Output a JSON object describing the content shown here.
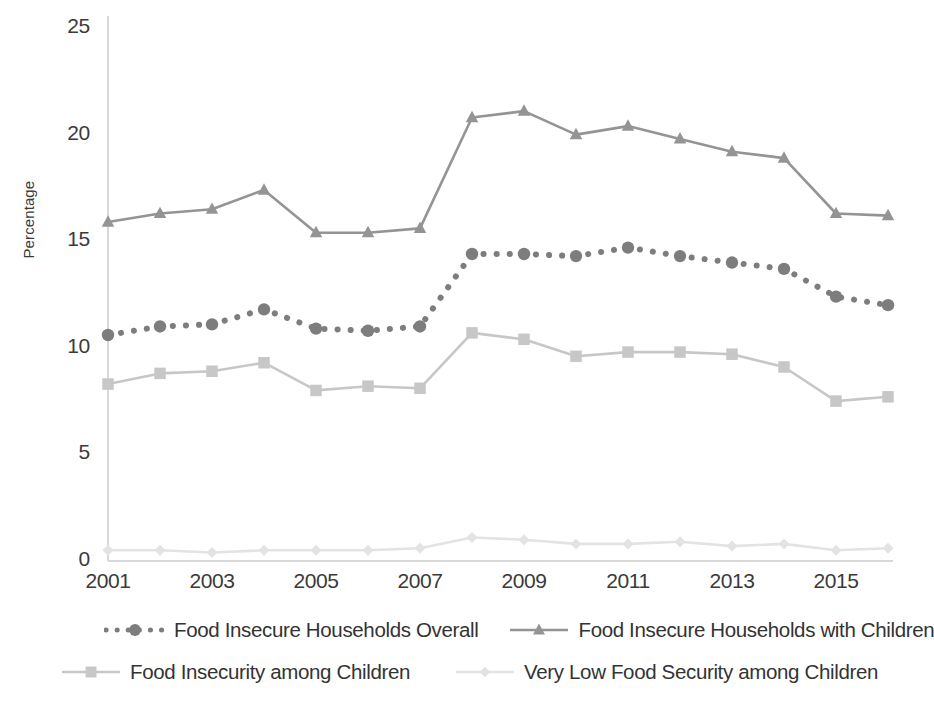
{
  "chart_data": {
    "type": "line",
    "title": "",
    "subtitle": "",
    "xlabel": "",
    "ylabel": "Percentage",
    "x": [
      2001,
      2002,
      2003,
      2004,
      2005,
      2006,
      2007,
      2008,
      2009,
      2010,
      2011,
      2012,
      2013,
      2014,
      2015,
      2016
    ],
    "xtick_labels": [
      "2001",
      "2003",
      "2005",
      "2007",
      "2009",
      "2011",
      "2013",
      "2015"
    ],
    "xtick_values": [
      2001,
      2003,
      2005,
      2007,
      2009,
      2011,
      2013,
      2015
    ],
    "ytick_labels": [
      "0",
      "5",
      "10",
      "15",
      "20",
      "25"
    ],
    "ytick_values": [
      0,
      5,
      10,
      15,
      20,
      25
    ],
    "ylim": [
      0,
      25
    ],
    "xlim": [
      2001,
      2016
    ],
    "grid": false,
    "legend_position": "bottom",
    "series": [
      {
        "name": "Food Insecure Households Overall",
        "marker": "circle",
        "linestyle": "dotted",
        "color": "#7d7d7d",
        "values": [
          10.6,
          11.0,
          11.1,
          11.8,
          10.9,
          10.8,
          11.0,
          14.4,
          14.4,
          14.3,
          14.7,
          14.3,
          14.0,
          13.7,
          12.4,
          12.0
        ]
      },
      {
        "name": "Food Insecure Households with Children",
        "marker": "triangle",
        "linestyle": "solid",
        "color": "#949494",
        "values": [
          15.9,
          16.3,
          16.5,
          17.4,
          15.4,
          15.4,
          15.6,
          20.8,
          21.1,
          20.0,
          20.4,
          19.8,
          19.2,
          18.9,
          16.3,
          16.2
        ]
      },
      {
        "name": "Food Insecurity among Children",
        "marker": "square",
        "linestyle": "solid",
        "color": "#c7c7c7",
        "values": [
          8.3,
          8.8,
          8.9,
          9.3,
          8.0,
          8.2,
          8.1,
          10.7,
          10.4,
          9.6,
          9.8,
          9.8,
          9.7,
          9.1,
          7.5,
          7.7
        ]
      },
      {
        "name": "Very Low Food Security among Children",
        "marker": "diamond",
        "linestyle": "solid",
        "color": "#e3e3e3",
        "values": [
          0.5,
          0.5,
          0.4,
          0.5,
          0.5,
          0.5,
          0.6,
          1.1,
          1.0,
          0.8,
          0.8,
          0.9,
          0.7,
          0.8,
          0.5,
          0.6
        ]
      }
    ]
  },
  "axis": {
    "y_title": "Percentage",
    "axis_color": "#d9d9d9"
  }
}
